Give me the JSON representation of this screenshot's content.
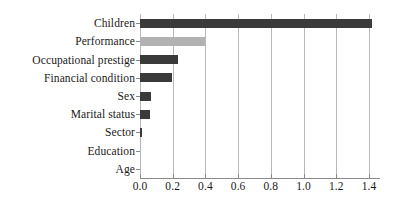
{
  "chart_data": {
    "type": "bar",
    "orientation": "horizontal",
    "title": "",
    "subtitle": "",
    "xlabel": "",
    "ylabel": "",
    "xlim": [
      0.0,
      1.45
    ],
    "xticks": [
      "0.0",
      "0.2",
      "0.4",
      "0.6",
      "0.8",
      "1.0",
      "1.2",
      "1.4"
    ],
    "xtick_values": [
      0.0,
      0.2,
      0.4,
      0.6,
      0.8,
      1.0,
      1.2,
      1.4
    ],
    "grid": "vertical",
    "legend": "none",
    "categories": [
      "Children",
      "Performance",
      "Occupational prestige",
      "Financial condition",
      "Sex",
      "Marital status",
      "Sector",
      "Education",
      "Age"
    ],
    "values": [
      1.42,
      0.395,
      0.232,
      0.193,
      0.069,
      0.061,
      0.012,
      0.002,
      0.001
    ],
    "bar_colors": [
      "#3a3a3a",
      "#b2b2b2",
      "#3a3a3a",
      "#3a3a3a",
      "#3a3a3a",
      "#3a3a3a",
      "#3a3a3a",
      "#3a3a3a",
      "#3a3a3a"
    ]
  },
  "colors": {
    "bar_dark": "#3a3a3a",
    "bar_light": "#b2b2b2",
    "gridline": "#b9b9b9",
    "axis": "#8a8a8a",
    "text": "#1a1a1a",
    "background": "#ffffff"
  }
}
